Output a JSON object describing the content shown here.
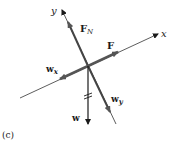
{
  "figure": {
    "panel_label": "(c)",
    "axes": {
      "x_label": "x",
      "y_label": "y"
    },
    "forces": {
      "normal_force": {
        "symbol": "F",
        "subscript": "N"
      },
      "applied_force": {
        "symbol": "F"
      },
      "weight_x": {
        "symbol": "w",
        "subscript": "x"
      },
      "weight_y": {
        "symbol": "w",
        "subscript": "y"
      },
      "weight": {
        "symbol": "w"
      }
    },
    "colors": {
      "ink": "#1a1a1a",
      "axis": "#333333",
      "force_shaded": "#555555"
    }
  }
}
